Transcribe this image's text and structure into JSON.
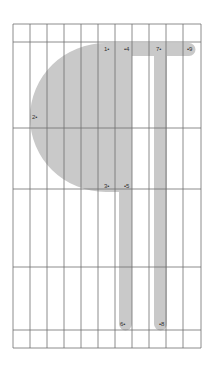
{
  "diagram": {
    "type": "glyph-construction-grid",
    "colors": {
      "background": "#ffffff",
      "grid_line": "#6e6e6e",
      "shape_fill": "#c9c9c9",
      "label": "#333333"
    },
    "grid": {
      "vertical_lines_x": [
        13,
        30,
        47,
        64,
        81,
        98,
        115,
        132,
        149,
        166,
        183,
        201
      ],
      "horizontal_lines_y": [
        24,
        42,
        128,
        189,
        267,
        330,
        348
      ],
      "left": 13,
      "right": 201,
      "top": 24,
      "bottom": 348
    },
    "points": [
      {
        "id": "1",
        "text": "1•",
        "x": 104,
        "y": 46
      },
      {
        "id": "2",
        "text": "2•",
        "x": 32,
        "y": 114
      },
      {
        "id": "3",
        "text": "3•",
        "x": 104,
        "y": 183
      },
      {
        "id": "4",
        "text": "•4",
        "x": 124,
        "y": 46
      },
      {
        "id": "5",
        "text": "•5",
        "x": 124,
        "y": 183
      },
      {
        "id": "6",
        "text": "6•",
        "x": 120,
        "y": 321
      },
      {
        "id": "7",
        "text": "7•",
        "x": 156,
        "y": 46
      },
      {
        "id": "8",
        "text": "•8",
        "x": 159,
        "y": 321
      },
      {
        "id": "9",
        "text": "•9",
        "x": 187,
        "y": 46
      }
    ]
  }
}
